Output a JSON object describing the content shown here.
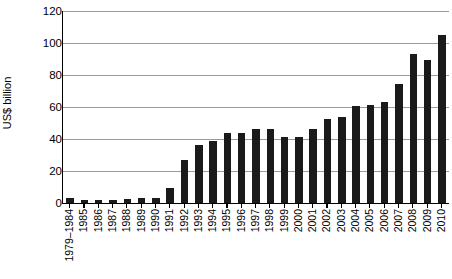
{
  "chart_data": {
    "type": "bar",
    "title": "",
    "subtitle": "",
    "xlabel": "",
    "ylabel": "US$ billion",
    "ylim": [
      0,
      120
    ],
    "yticks": [
      0,
      20,
      40,
      60,
      80,
      100,
      120
    ],
    "grid": true,
    "legend": false,
    "bar_color": "#1a1a1a",
    "categories": [
      "1979–1984",
      "1985",
      "1986",
      "1987",
      "1988",
      "1989",
      "1990",
      "1991",
      "1992",
      "1993",
      "1994",
      "1995",
      "1996",
      "1997",
      "1998",
      "1999",
      "2000",
      "2001",
      "2002",
      "2003",
      "2004",
      "2005",
      "2006",
      "2007",
      "2008",
      "2009",
      "2010"
    ],
    "values": [
      3,
      2,
      2,
      2,
      2.5,
      3,
      3,
      9.5,
      27,
      36,
      38.5,
      43.5,
      44,
      46,
      46,
      41,
      41,
      46,
      52.5,
      54,
      60.5,
      61,
      63,
      74.5,
      93,
      89.5,
      105
    ]
  }
}
